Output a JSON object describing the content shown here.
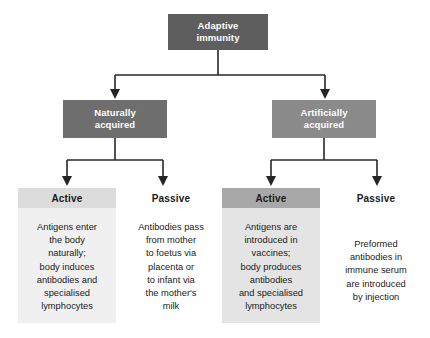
{
  "diagram": {
    "title_text": "Adaptive immunity",
    "root": {
      "label": "Adaptive\nimmunity",
      "line1": "Adaptive",
      "line2": "immunity",
      "color": "#5e5e5e"
    },
    "level2": [
      {
        "name": "naturally-acquired",
        "line1": "Naturally",
        "line2": "acquired",
        "color": "#6e6e6e"
      },
      {
        "name": "artificially-acquired",
        "line1": "Artificially",
        "line2": "acquired",
        "color": "#8a8a8a"
      }
    ],
    "columns": [
      {
        "name": "naturally-acquired-active",
        "heading": "Active",
        "heading_color": "#dcdcdc",
        "body_color": "#f0f0f0",
        "body": "Antigens enter the body naturally; body induces antibodies and specialised lymphocytes",
        "body_lines": [
          "Antigens enter",
          "the body",
          "naturally;",
          "body induces",
          "antibodies and",
          "specialised",
          "lymphocytes"
        ]
      },
      {
        "name": "naturally-acquired-passive",
        "heading": "Passive",
        "heading_color": "#ffffff",
        "body_color": "#ffffff",
        "body": "Antibodies pass from mother to foetus via placenta or to infant via the mother's milk",
        "body_lines": [
          "Antibodies pass",
          "from mother",
          "to foetus via",
          "placenta or",
          "to infant via",
          "the mother's",
          "milk"
        ]
      },
      {
        "name": "artificially-acquired-active",
        "heading": "Active",
        "heading_color": "#a8a8a8",
        "body_color": "#e4e4e4",
        "body": "Antigens are introduced in vaccines; body produces antibodies and specialised lymphocytes",
        "body_lines": [
          "Antigens are",
          "introduced in",
          "vaccines;",
          "body produces",
          "antibodies",
          "and specialised",
          "lymphocytes"
        ]
      },
      {
        "name": "artificially-acquired-passive",
        "heading": "Passive",
        "heading_color": "#ffffff",
        "body_color": "#ffffff",
        "body": "Preformed antibodies in immune serum are introduced by injection",
        "body_lines": [
          "Preformed",
          "antibodies in",
          "immune serum",
          "are introduced",
          "by injection"
        ]
      }
    ],
    "connector_color": "#262626"
  }
}
